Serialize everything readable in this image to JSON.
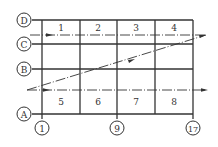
{
  "diagram": {
    "row_axes": [
      {
        "label": "D",
        "y": 20
      },
      {
        "label": "C",
        "y": 44
      },
      {
        "label": "B",
        "y": 69
      },
      {
        "label": "A",
        "y": 114
      }
    ],
    "column_axes": [
      {
        "label": "1",
        "x": 42
      },
      {
        "label": "9",
        "x": 117
      },
      {
        "label": "17",
        "x": 193
      }
    ],
    "grid_columns_x": [
      42,
      80,
      117,
      155,
      193
    ],
    "top_bays": [
      "1",
      "2",
      "3",
      "4"
    ],
    "bottom_bays": [
      "5",
      "6",
      "7",
      "8"
    ],
    "colors": {
      "line": "#333333",
      "background": "#ffffff"
    }
  }
}
